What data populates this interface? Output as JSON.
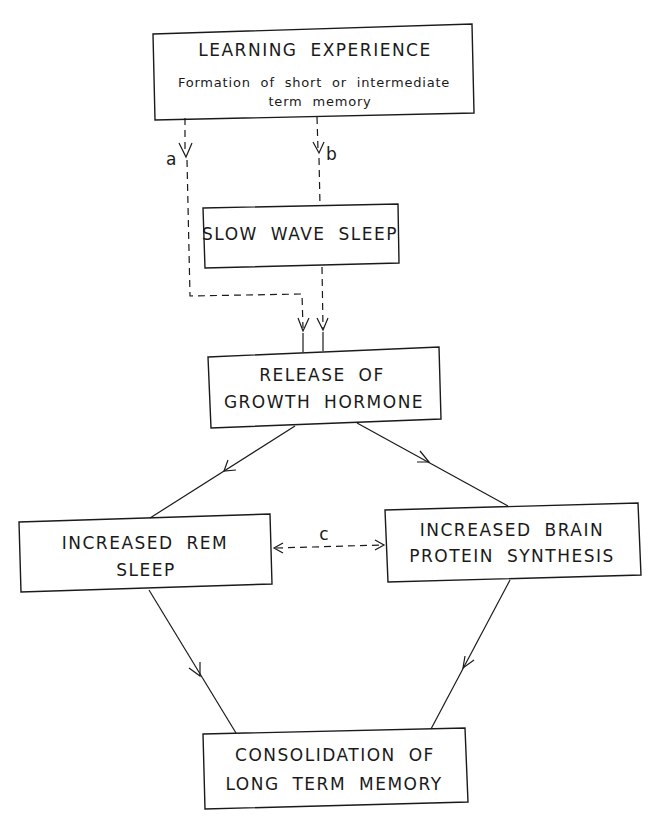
{
  "nodes": {
    "learning": {
      "title": "LEARNING EXPERIENCE",
      "subtitle_line1": "Formation of short or intermediate",
      "subtitle_line2": "term memory"
    },
    "sws": {
      "line1": "SLOW WAVE SLEEP"
    },
    "gh": {
      "line1": "RELEASE OF",
      "line2": "GROWTH HORMONE"
    },
    "rem": {
      "line1": "INCREASED REM",
      "line2": "SLEEP"
    },
    "protein": {
      "line1": "INCREASED BRAIN",
      "line2": "PROTEIN SYNTHESIS"
    },
    "consolidation": {
      "line1": "CONSOLIDATION OF",
      "line2": "LONG TERM MEMORY"
    }
  },
  "edges": {
    "a": {
      "label": "a",
      "from": "learning",
      "to": "gh",
      "style": "dashed"
    },
    "b": {
      "label": "b",
      "from": "learning",
      "to": "sws",
      "style": "dashed"
    },
    "sws_gh": {
      "from": "sws",
      "to": "gh",
      "style": "dashed"
    },
    "gh_rem": {
      "from": "gh",
      "to": "rem",
      "style": "solid"
    },
    "gh_protein": {
      "from": "gh",
      "to": "protein",
      "style": "solid"
    },
    "c": {
      "label": "c",
      "from": "rem",
      "to": "protein",
      "style": "dashed-bidirectional"
    },
    "rem_cons": {
      "from": "rem",
      "to": "consolidation",
      "style": "solid"
    },
    "protein_cons": {
      "from": "protein",
      "to": "consolidation",
      "style": "solid"
    }
  }
}
